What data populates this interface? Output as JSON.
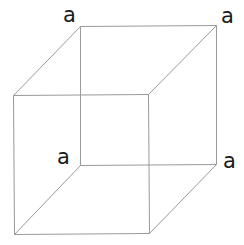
{
  "diagram": {
    "type": "wireframe-cube",
    "line_color": "#9a9a9a",
    "label_color": "#1a1a1a",
    "vertices": {
      "front_top_left": [
        13,
        95
      ],
      "front_top_right": [
        148,
        94
      ],
      "front_bottom_left": [
        14,
        234
      ],
      "front_bottom_right": [
        149,
        233
      ],
      "back_top_left": [
        80,
        26
      ],
      "back_top_right": [
        216,
        25
      ],
      "back_bottom_left": [
        80,
        165
      ],
      "back_bottom_right": [
        216,
        164
      ]
    },
    "labels": [
      {
        "id": "back-top-left",
        "text": "a",
        "x": 63,
        "y": 22
      },
      {
        "id": "back-top-right",
        "text": "a",
        "x": 221,
        "y": 23
      },
      {
        "id": "back-bottom-left",
        "text": "a",
        "x": 57,
        "y": 164
      },
      {
        "id": "back-bottom-right",
        "text": "a",
        "x": 223,
        "y": 168
      }
    ]
  }
}
